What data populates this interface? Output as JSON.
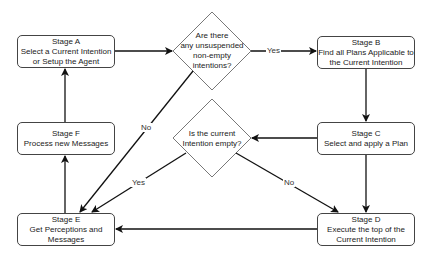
{
  "diagram": {
    "type": "flowchart",
    "nodes": {
      "stage_a": {
        "title": "Stage A",
        "line1": "Select a Current Intention",
        "line2": "or Setup the Agent"
      },
      "stage_b": {
        "title": "Stage B",
        "line1": "Find all Plans Applicable to",
        "line2": "the Current Intention"
      },
      "stage_c": {
        "title": "Stage C",
        "line1": "Select and apply a Plan"
      },
      "stage_d": {
        "title": "Stage D",
        "line1": "Execute the top of the",
        "line2": "Current Intention"
      },
      "stage_e": {
        "title": "Stage E",
        "line1": "Get Perceptions and",
        "line2": "Messages"
      },
      "stage_f": {
        "title": "Stage F",
        "line1": "Process new Messages"
      },
      "decision_1": {
        "line1": "Are there",
        "line2": "any unsuspended",
        "line3": "non-empty",
        "line4": "intentions?"
      },
      "decision_2": {
        "line1": "Is the current",
        "line2": "Intention empty?"
      }
    },
    "edges": [
      {
        "from": "stage_a",
        "to": "decision_1",
        "label": ""
      },
      {
        "from": "decision_1",
        "to": "stage_b",
        "label": "Yes"
      },
      {
        "from": "decision_1",
        "to": "stage_e",
        "label": "No"
      },
      {
        "from": "stage_b",
        "to": "stage_c",
        "label": ""
      },
      {
        "from": "stage_c",
        "to": "decision_2",
        "label": ""
      },
      {
        "from": "stage_c",
        "to": "stage_d",
        "label": ""
      },
      {
        "from": "decision_2",
        "to": "stage_e",
        "label": "Yes"
      },
      {
        "from": "decision_2",
        "to": "stage_d",
        "label": "No"
      },
      {
        "from": "stage_d",
        "to": "stage_e",
        "label": ""
      },
      {
        "from": "stage_e",
        "to": "stage_f",
        "label": ""
      },
      {
        "from": "stage_f",
        "to": "stage_a",
        "label": ""
      }
    ],
    "labels": {
      "yes": "Yes",
      "no": "No"
    }
  }
}
